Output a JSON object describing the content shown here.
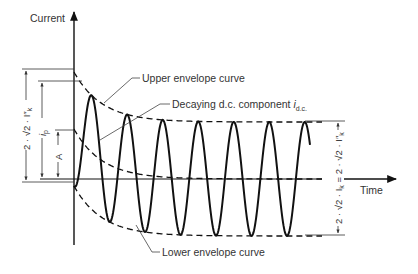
{
  "axes": {
    "y_label": "Current",
    "x_label": "Time"
  },
  "annotations": {
    "upper_envelope": "Upper envelope curve",
    "lower_envelope": "Lower envelope curve",
    "dc_component": "Decaying d.c. component ",
    "dc_symbol": "i",
    "dc_sub": "d.c."
  },
  "left_dimensions": {
    "outer": "2 · √2 · I″",
    "outer_sub": "k",
    "peak": "i",
    "peak_sub": "p",
    "a": "A"
  },
  "right_dimension": {
    "text": "2 · √2 · I",
    "sub1": "k",
    "mid": " = 2 · √2 · I″",
    "sub2": "k"
  },
  "colors": {
    "line": "#111111",
    "thin": "#333333",
    "text": "#333333"
  }
}
